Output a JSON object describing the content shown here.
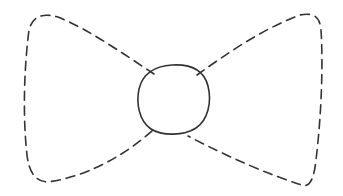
{
  "diagram": {
    "stroke_color": "#333333",
    "background": "#ffffff",
    "parts": [
      {
        "name": "left-wing",
        "style": "dashed"
      },
      {
        "name": "knot",
        "style": "solid"
      },
      {
        "name": "right-wing",
        "style": "dashed"
      }
    ]
  }
}
